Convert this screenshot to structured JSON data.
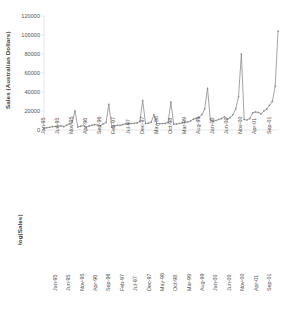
{
  "figure": {
    "background": "#ffffff",
    "series_color": "#8c8c8c",
    "axis_color": "#d3d3d3"
  },
  "chart_data": [
    {
      "type": "line",
      "panel": "top",
      "title": "",
      "xlabel": "",
      "ylabel": "Sales (Australian Dollars)",
      "yscale": "linear",
      "ylim": [
        0,
        120000
      ],
      "yticks": [
        0,
        20000,
        40000,
        60000,
        80000,
        100000,
        120000
      ],
      "ytick_labels": [
        "0",
        "20000",
        "40000",
        "60000",
        "80000",
        "100000",
        "120000"
      ],
      "grid": false,
      "legend": "none",
      "marker": "diamond",
      "xtick_labels": [
        "Jan-95",
        "Jun-95",
        "Nov-95",
        "Apr-96",
        "Sep-96",
        "Feb-97",
        "Jul-97",
        "Dec-97",
        "May-98",
        "Oct-98",
        "Mar-99",
        "Aug-99",
        "Jan-00",
        "Jun-00",
        "Nov-00",
        "Apr-01",
        "Sep-01"
      ],
      "xtick_every_n_points": 5,
      "x": [
        "Jan-95",
        "Feb-95",
        "Mar-95",
        "Apr-95",
        "May-95",
        "Jun-95",
        "Jul-95",
        "Aug-95",
        "Sep-95",
        "Oct-95",
        "Nov-95",
        "Dec-95",
        "Jan-96",
        "Feb-96",
        "Mar-96",
        "Apr-96",
        "May-96",
        "Jun-96",
        "Jul-96",
        "Aug-96",
        "Sep-96",
        "Oct-96",
        "Nov-96",
        "Dec-96",
        "Jan-97",
        "Feb-97",
        "Mar-97",
        "Apr-97",
        "May-97",
        "Jun-97",
        "Jul-97",
        "Aug-97",
        "Sep-97",
        "Oct-97",
        "Nov-97",
        "Dec-97",
        "Jan-98",
        "Feb-98",
        "Mar-98",
        "Apr-98",
        "May-98",
        "Jun-98",
        "Jul-98",
        "Aug-98",
        "Sep-98",
        "Oct-98",
        "Nov-98",
        "Dec-98",
        "Jan-99",
        "Feb-99",
        "Mar-99",
        "Apr-99",
        "May-99",
        "Jun-99",
        "Jul-99",
        "Aug-99",
        "Sep-99",
        "Oct-99",
        "Nov-99",
        "Dec-99",
        "Jan-00",
        "Feb-00",
        "Mar-00",
        "Apr-00",
        "May-00",
        "Jun-00",
        "Jul-00",
        "Aug-00",
        "Sep-00",
        "Oct-00",
        "Nov-00",
        "Dec-00",
        "Jan-01",
        "Feb-01",
        "Mar-01",
        "Apr-01",
        "May-01",
        "Jun-01",
        "Jul-01",
        "Aug-01",
        "Sep-01",
        "Oct-01",
        "Nov-01",
        "Dec-01"
      ],
      "values": [
        1664,
        2397,
        2840,
        3547,
        3752,
        3714,
        4349,
        3566,
        5021,
        6423,
        7873,
        20000,
        3107,
        4022,
        4775,
        3118,
        4107,
        5123,
        5696,
        5215,
        4455,
        6465,
        7970,
        27000,
        3220,
        4200,
        4950,
        4900,
        5650,
        6500,
        6700,
        6900,
        7000,
        7500,
        9000,
        31000,
        6950,
        7100,
        8250,
        16000,
        6950,
        6550,
        6800,
        7000,
        7800,
        29500,
        6100,
        6250,
        6900,
        7500,
        8000,
        8500,
        9500,
        11500,
        12000,
        13500,
        16000,
        22000,
        44000,
        10500,
        9500,
        10000,
        11000,
        12000,
        14000,
        11000,
        13000,
        16000,
        22000,
        35000,
        80000,
        11000,
        10500,
        12000,
        18000,
        19000,
        18500,
        17000,
        20000,
        22000,
        26000,
        30000,
        46000,
        104000
      ],
      "peaks": [
        {
          "x": "Dec-95",
          "y": 20000
        },
        {
          "x": "Dec-96",
          "y": 27000
        },
        {
          "x": "Dec-97",
          "y": 31000
        },
        {
          "x": "Apr-98",
          "y": 16000
        },
        {
          "x": "Oct-98",
          "y": 29500
        },
        {
          "x": "Nov-99",
          "y": 44000
        },
        {
          "x": "Nov-00",
          "y": 80000
        },
        {
          "x": "Dec-01",
          "y": 104000
        }
      ]
    },
    {
      "type": "line",
      "panel": "bottom",
      "title": "",
      "xlabel": "",
      "ylabel": "log(Sales)",
      "yscale": "log",
      "ylim": [
        1000,
        1000000
      ],
      "yticks": [
        1000,
        10000,
        100000,
        1000000
      ],
      "ytick_labels": [
        "1000",
        "10000",
        "100000",
        "1000000"
      ],
      "grid": false,
      "legend": "none",
      "marker": "diamond",
      "xtick_labels": [
        "Jan-95",
        "Jun-95",
        "Nov-95",
        "Apr-96",
        "Sep-96",
        "Feb-97",
        "Jul-97",
        "Dec-97",
        "May-98",
        "Oct-98",
        "Mar-99",
        "Aug-99",
        "Jan-00",
        "Jun-00",
        "Nov-00",
        "Apr-01",
        "Sep-01"
      ],
      "xtick_every_n_points": 5,
      "x": [
        "Jan-95",
        "Feb-95",
        "Mar-95",
        "Apr-95",
        "May-95",
        "Jun-95",
        "Jul-95",
        "Aug-95",
        "Sep-95",
        "Oct-95",
        "Nov-95",
        "Dec-95",
        "Jan-96",
        "Feb-96",
        "Mar-96",
        "Apr-96",
        "May-96",
        "Jun-96",
        "Jul-96",
        "Aug-96",
        "Sep-96",
        "Oct-96",
        "Nov-96",
        "Dec-96",
        "Jan-97",
        "Feb-97",
        "Mar-97",
        "Apr-97",
        "May-97",
        "Jun-97",
        "Jul-97",
        "Aug-97",
        "Sep-97",
        "Oct-97",
        "Nov-97",
        "Dec-97",
        "Jan-98",
        "Feb-98",
        "Mar-98",
        "Apr-98",
        "May-98",
        "Jun-98",
        "Jul-98",
        "Aug-98",
        "Sep-98",
        "Oct-98",
        "Nov-98",
        "Dec-98",
        "Jan-99",
        "Feb-99",
        "Mar-99",
        "Apr-99",
        "May-99",
        "Jun-99",
        "Jul-99",
        "Aug-99",
        "Sep-99",
        "Oct-99",
        "Nov-99",
        "Dec-99",
        "Jan-00",
        "Feb-00",
        "Mar-00",
        "Apr-00",
        "May-00",
        "Jun-00",
        "Jul-00",
        "Aug-00",
        "Sep-00",
        "Oct-00",
        "Nov-00",
        "Dec-00",
        "Jan-01",
        "Feb-01",
        "Mar-01",
        "Apr-01",
        "May-01",
        "Jun-01",
        "Jul-01",
        "Aug-01",
        "Sep-01",
        "Oct-01",
        "Nov-01",
        "Dec-01"
      ],
      "values": [
        1664,
        2397,
        2840,
        3547,
        3752,
        3714,
        4349,
        3566,
        5021,
        6423,
        7873,
        20000,
        3107,
        4022,
        4775,
        3118,
        4107,
        5123,
        5696,
        5215,
        4455,
        6465,
        7970,
        27000,
        3220,
        4200,
        4950,
        4900,
        5650,
        6500,
        6700,
        6900,
        7000,
        7500,
        9000,
        31000,
        6950,
        7100,
        8250,
        16000,
        6950,
        6550,
        6800,
        7000,
        7800,
        29500,
        6100,
        6250,
        6900,
        7500,
        8000,
        8500,
        9500,
        11500,
        12000,
        13500,
        16000,
        22000,
        44000,
        10500,
        9500,
        10000,
        11000,
        12000,
        14000,
        11000,
        13000,
        16000,
        22000,
        35000,
        80000,
        11000,
        10500,
        12000,
        18000,
        19000,
        18500,
        17000,
        20000,
        22000,
        26000,
        30000,
        46000,
        104000
      ]
    }
  ]
}
